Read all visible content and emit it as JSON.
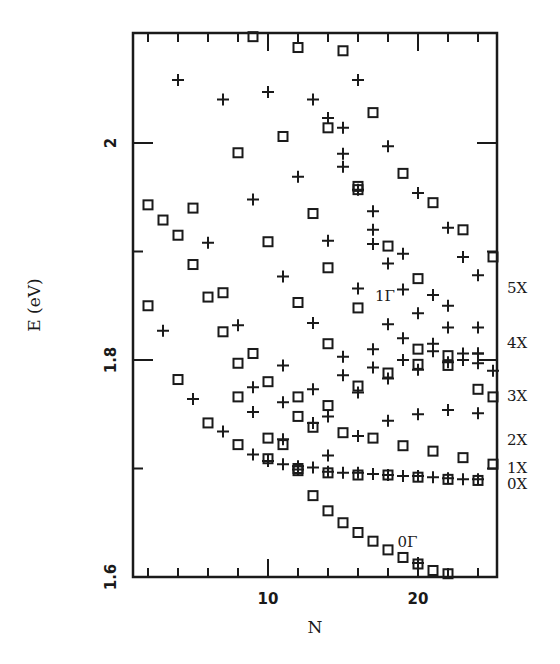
{
  "chart_data": {
    "type": "scatter",
    "title": "",
    "xlabel": "N",
    "ylabel": "E (eV)",
    "xlim": [
      1,
      25.3
    ],
    "ylim": [
      1.6,
      2.101
    ],
    "x_ticks": [
      {
        "value": 10,
        "label": "10"
      },
      {
        "value": 20,
        "label": "20"
      }
    ],
    "x_minor_ticks": [
      2,
      4,
      6,
      8,
      12,
      14,
      16,
      18,
      22,
      24
    ],
    "y_ticks": [
      {
        "value": 1.6,
        "label": "1.6"
      },
      {
        "value": 1.8,
        "label": "1.8"
      },
      {
        "value": 2.0,
        "label": "2"
      }
    ],
    "y_minor_ticks": [
      1.7,
      1.9
    ],
    "grid": false,
    "legend": "none",
    "marker_color": "#1a1a1a",
    "series": [
      {
        "name": "squares",
        "marker": "square",
        "points": [
          [
            2,
            1.943
          ],
          [
            3,
            1.929
          ],
          [
            4,
            1.915
          ],
          [
            5,
            1.94
          ],
          [
            9,
            2.098
          ],
          [
            12,
            2.088
          ],
          [
            15,
            2.085
          ],
          [
            8,
            1.991
          ],
          [
            11,
            2.006
          ],
          [
            14,
            2.014
          ],
          [
            17,
            2.028
          ],
          [
            5,
            1.888
          ],
          [
            6,
            1.858
          ],
          [
            7,
            1.862
          ],
          [
            10,
            1.909
          ],
          [
            13,
            1.935
          ],
          [
            16,
            1.96
          ],
          [
            19,
            1.972
          ],
          [
            21,
            1.945
          ],
          [
            23,
            1.92
          ],
          [
            25,
            1.895
          ],
          [
            2,
            1.85
          ],
          [
            4,
            1.782
          ],
          [
            7,
            1.826
          ],
          [
            8,
            1.797
          ],
          [
            9,
            1.806
          ],
          [
            12,
            1.853
          ],
          [
            14,
            1.885
          ],
          [
            18,
            1.905
          ],
          [
            20,
            1.875
          ],
          [
            6,
            1.742
          ],
          [
            8,
            1.766
          ],
          [
            10,
            1.78
          ],
          [
            12,
            1.766
          ],
          [
            14,
            1.815
          ],
          [
            16,
            1.848
          ],
          [
            20,
            1.81
          ],
          [
            22,
            1.795
          ],
          [
            24,
            1.773
          ],
          [
            25,
            1.766
          ],
          [
            8,
            1.722
          ],
          [
            10,
            1.728
          ],
          [
            12,
            1.748
          ],
          [
            14,
            1.758
          ],
          [
            16,
            1.776
          ],
          [
            18,
            1.788
          ],
          [
            20,
            1.796
          ],
          [
            22,
            1.804
          ],
          [
            10,
            1.709
          ],
          [
            11,
            1.722
          ],
          [
            13,
            1.738
          ],
          [
            15,
            1.733
          ],
          [
            17,
            1.728
          ],
          [
            19,
            1.721
          ],
          [
            21,
            1.716
          ],
          [
            23,
            1.71
          ],
          [
            25,
            1.704
          ],
          [
            12,
            1.7
          ],
          [
            14,
            1.696
          ],
          [
            16,
            1.694
          ],
          [
            18,
            1.694
          ],
          [
            20,
            1.692
          ],
          [
            22,
            1.69
          ],
          [
            24,
            1.689
          ],
          [
            12,
            1.698
          ],
          [
            13,
            1.675
          ],
          [
            14,
            1.661
          ],
          [
            15,
            1.65
          ],
          [
            16,
            1.641
          ],
          [
            17,
            1.633
          ],
          [
            18,
            1.625
          ],
          [
            19,
            1.618
          ],
          [
            20,
            1.612
          ],
          [
            21,
            1.606
          ],
          [
            22,
            1.603
          ]
        ]
      },
      {
        "name": "crosses",
        "marker": "cross",
        "points": [
          [
            4,
            2.058
          ],
          [
            7,
            2.04
          ],
          [
            10,
            2.047
          ],
          [
            13,
            2.04
          ],
          [
            14,
            2.023
          ],
          [
            16,
            2.058
          ],
          [
            15,
            2.014
          ],
          [
            15,
            1.99
          ],
          [
            18,
            1.997
          ],
          [
            15,
            1.978
          ],
          [
            12,
            1.969
          ],
          [
            9,
            1.948
          ],
          [
            17,
            1.937
          ],
          [
            20,
            1.954
          ],
          [
            14,
            1.91
          ],
          [
            17,
            1.92
          ],
          [
            17,
            1.907
          ],
          [
            22,
            1.922
          ],
          [
            23,
            1.895
          ],
          [
            24,
            1.878
          ],
          [
            6,
            1.908
          ],
          [
            11,
            1.877
          ],
          [
            16,
            1.866
          ],
          [
            18,
            1.889
          ],
          [
            19,
            1.898
          ],
          [
            19,
            1.865
          ],
          [
            21,
            1.86
          ],
          [
            22,
            1.85
          ],
          [
            3,
            1.827
          ],
          [
            8,
            1.832
          ],
          [
            13,
            1.834
          ],
          [
            18,
            1.833
          ],
          [
            20,
            1.843
          ],
          [
            22,
            1.83
          ],
          [
            24,
            1.83
          ],
          [
            5,
            1.764
          ],
          [
            9,
            1.775
          ],
          [
            11,
            1.795
          ],
          [
            15,
            1.803
          ],
          [
            17,
            1.81
          ],
          [
            19,
            1.82
          ],
          [
            21,
            1.815
          ],
          [
            23,
            1.806
          ],
          [
            24,
            1.806
          ],
          [
            25,
            1.79
          ],
          [
            7,
            1.734
          ],
          [
            9,
            1.752
          ],
          [
            11,
            1.761
          ],
          [
            13,
            1.773
          ],
          [
            15,
            1.786
          ],
          [
            17,
            1.793
          ],
          [
            19,
            1.8
          ],
          [
            21,
            1.808
          ],
          [
            23,
            1.8
          ],
          [
            24,
            1.797
          ],
          [
            9,
            1.713
          ],
          [
            11,
            1.727
          ],
          [
            13,
            1.742
          ],
          [
            14,
            1.748
          ],
          [
            16,
            1.77
          ],
          [
            18,
            1.783
          ],
          [
            20,
            1.791
          ],
          [
            22,
            1.798
          ],
          [
            24,
            1.806
          ],
          [
            11,
            1.704
          ],
          [
            13,
            1.701
          ],
          [
            15,
            1.696
          ],
          [
            17,
            1.695
          ],
          [
            19,
            1.693
          ],
          [
            21,
            1.692
          ],
          [
            23,
            1.69
          ],
          [
            10,
            1.707
          ],
          [
            12,
            1.702
          ],
          [
            14,
            1.712
          ],
          [
            16,
            1.73
          ],
          [
            18,
            1.744
          ],
          [
            20,
            1.75
          ],
          [
            22,
            1.754
          ],
          [
            24,
            1.751
          ],
          [
            12,
            1.699
          ],
          [
            14,
            1.697
          ],
          [
            16,
            1.696
          ],
          [
            18,
            1.694
          ],
          [
            20,
            1.693
          ],
          [
            22,
            1.691
          ],
          [
            24,
            1.69
          ],
          [
            20,
            1.613
          ]
        ]
      }
    ],
    "circled_points": [
      [
        16,
        1.957
      ]
    ],
    "series_labels": [
      {
        "text": "5X",
        "side": "right",
        "E": 1.867
      },
      {
        "text": "4X",
        "side": "right",
        "E": 1.817
      },
      {
        "text": "3X",
        "side": "right",
        "E": 1.768
      },
      {
        "text": "2X",
        "side": "right",
        "E": 1.727
      },
      {
        "text": "1X",
        "side": "right",
        "E": 1.701
      },
      {
        "text": "0X",
        "side": "right",
        "E": 1.687
      },
      {
        "text": "1Γ",
        "N": 17.8,
        "E": 1.86
      },
      {
        "text": "0Γ",
        "N": 19.3,
        "E": 1.633
      }
    ]
  }
}
